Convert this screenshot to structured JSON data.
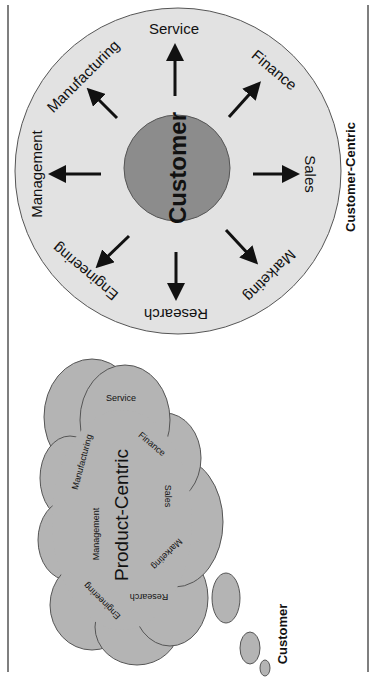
{
  "customer_centric": {
    "title": "Customer-Centric",
    "center_label": "Customer",
    "departments": [
      "Service",
      "Finance",
      "Sales",
      "Marketing",
      "Research",
      "Engineering",
      "Management",
      "Manufacturing"
    ],
    "colors": {
      "outer": "#e2e2e2",
      "inner": "#8c8c8c",
      "stroke": "#555555",
      "arrow": "#111111"
    }
  },
  "product_centric": {
    "title": "Product-Centric",
    "departments": [
      "Service",
      "Finance",
      "Sales",
      "Marketing",
      "Research",
      "Engineering",
      "Management",
      "Manufacturing"
    ],
    "thought_owner": "Customer",
    "colors": {
      "cloud": "#b4b4b4",
      "stroke": "#555555"
    }
  }
}
